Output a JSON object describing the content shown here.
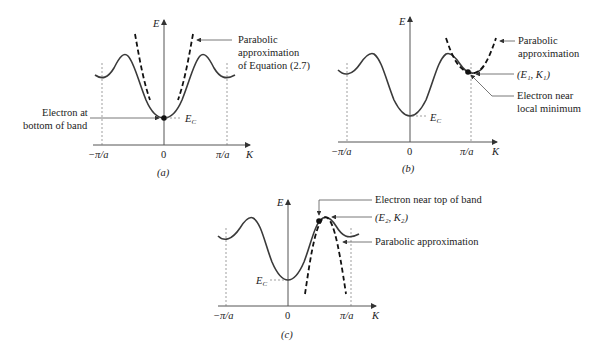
{
  "figure": {
    "panels": [
      {
        "id": "a",
        "caption": "(a)",
        "axis_y_label": "E",
        "axis_x_label": "K",
        "ticks": [
          "−π/a",
          "0",
          "π/a"
        ],
        "level_label": "E",
        "level_sub": "C",
        "annotations": {
          "parabola_line1": "Parabolic",
          "parabola_line2": "approximation",
          "parabola_line3": "of Equation (2.7)",
          "electron_line1": "Electron at",
          "electron_line2": "bottom of band"
        }
      },
      {
        "id": "b",
        "caption": "(b)",
        "axis_y_label": "E",
        "axis_x_label": "K",
        "ticks": [
          "−π/a",
          "0",
          "π/a"
        ],
        "level_label": "E",
        "level_sub": "C",
        "annotations": {
          "parabola_line1": "Parabolic",
          "parabola_line2": "approximation",
          "point_label": "(E₁, K₁)",
          "electron_line1": "Electron near",
          "electron_line2": "local minimum"
        }
      },
      {
        "id": "c",
        "caption": "(c)",
        "axis_y_label": "E",
        "axis_x_label": "K",
        "ticks": [
          "−π/a",
          "0",
          "π/a"
        ],
        "level_label": "E",
        "level_sub": "C",
        "annotations": {
          "electron_line1": "Electron near top of band",
          "point_label": "(E₂, K₂)",
          "parabola_line1": "Parabolic approximation"
        }
      }
    ]
  }
}
